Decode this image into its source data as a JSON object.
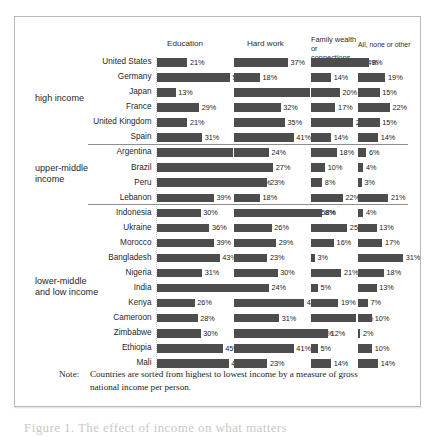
{
  "chart_data": {
    "type": "bar",
    "title": "",
    "subtitle": "",
    "xlabel": "",
    "ylabel": "",
    "grid": false,
    "legend_position": "top-columns-as-headers",
    "orientation": "horizontal",
    "value_suffix": "%",
    "axis_max_percent": 70,
    "columns": [
      {
        "label": "Education",
        "two_line": false
      },
      {
        "label": "Hard work",
        "two_line": false
      },
      {
        "label": "Family wealth or connections",
        "two_line": true,
        "line1": "Family wealth",
        "line2": "or connections"
      },
      {
        "label": "All, none or other",
        "two_line": false
      }
    ],
    "groups": [
      {
        "label": "high income",
        "label_lines": [
          "high income"
        ],
        "rows": [
          {
            "country": "United States",
            "values": [
              21,
              37,
              34,
              8
            ]
          },
          {
            "country": "Germany",
            "values": [
              50,
              18,
              14,
              19
            ]
          },
          {
            "country": "Japan",
            "values": [
              13,
              52,
              20,
              15
            ]
          },
          {
            "country": "France",
            "values": [
              29,
              32,
              17,
              22
            ]
          },
          {
            "country": "United Kingdom",
            "values": [
              21,
              35,
              29,
              15
            ]
          },
          {
            "country": "Spain",
            "values": [
              31,
              41,
              14,
              14
            ]
          }
        ]
      },
      {
        "label": "upper-middle income",
        "label_lines": [
          "upper-middle",
          "income"
        ],
        "rows": [
          {
            "country": "Argentina",
            "values": [
              52,
              24,
              18,
              6
            ]
          },
          {
            "country": "Brazil",
            "values": [
              59,
              27,
              10,
              4
            ]
          },
          {
            "country": "Peru",
            "values": [
              66,
              23,
              8,
              3
            ]
          },
          {
            "country": "Lebanon",
            "values": [
              39,
              18,
              22,
              21
            ]
          }
        ]
      },
      {
        "label": "lower-middle and low income",
        "label_lines": [
          "lower-middle",
          "and low income"
        ],
        "rows": [
          {
            "country": "Indonesia",
            "values": [
              30,
              58,
              8,
              4
            ]
          },
          {
            "country": "Ukraine",
            "values": [
              36,
              26,
              25,
              13
            ]
          },
          {
            "country": "Morocco",
            "values": [
              39,
              29,
              16,
              17
            ]
          },
          {
            "country": "Bangladesh",
            "values": [
              43,
              23,
              3,
              31
            ]
          },
          {
            "country": "Nigeria",
            "values": [
              31,
              30,
              21,
              18
            ]
          },
          {
            "country": "India",
            "values": [
              57,
              24,
              5,
              13
            ]
          },
          {
            "country": "Kenya",
            "values": [
              26,
              48,
              19,
              7
            ]
          },
          {
            "country": "Cameroon",
            "values": [
              28,
              31,
              31,
              10
            ]
          },
          {
            "country": "Zimbabwe",
            "values": [
              30,
              56,
              12,
              2
            ]
          },
          {
            "country": "Ethiopia",
            "values": [
              45,
              41,
              5,
              10
            ]
          },
          {
            "country": "Mali",
            "values": [
              49,
              23,
              14,
              14
            ]
          }
        ]
      }
    ],
    "bar_color": "#4d4d4d",
    "separator_color": "#8e8e8e"
  },
  "note": {
    "label": "Note:",
    "text": "Countries are sorted from highest to lowest income by a measure of gross national income per person."
  },
  "figure_caption_fragment": "Figure 1. The effect of income on what matters"
}
